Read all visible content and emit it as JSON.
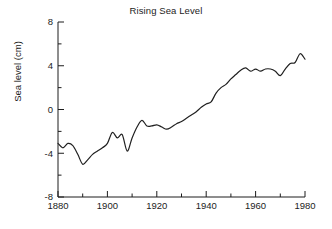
{
  "chart_data": {
    "type": "line",
    "title": "Rising Sea Level",
    "xlabel": "",
    "ylabel": "Sea level (cm)",
    "xlim": [
      1880,
      1980
    ],
    "ylim": [
      -8,
      8
    ],
    "grid": false,
    "legend": null,
    "xticks": [
      1880,
      1900,
      1920,
      1940,
      1960,
      1980
    ],
    "xticklabels": [
      "1880",
      "1900",
      "1920",
      "1940",
      "1960",
      "1980"
    ],
    "xminorticks": [
      1890,
      1910,
      1930,
      1950,
      1970
    ],
    "yticks": [
      -8,
      -4,
      0,
      4,
      8
    ],
    "yticklabels": [
      "-8",
      "-4",
      "0",
      "4",
      "8"
    ],
    "yminorticks": [
      -6,
      -2,
      2,
      6
    ],
    "line_color": "#202020",
    "line_width": 1.2,
    "series": [
      {
        "name": "Global mean sea level",
        "x": [
          1880,
          1882,
          1884,
          1886,
          1888,
          1890,
          1892,
          1894,
          1896,
          1898,
          1900,
          1902,
          1904,
          1906,
          1908,
          1910,
          1912,
          1914,
          1916,
          1918,
          1920,
          1922,
          1924,
          1926,
          1928,
          1930,
          1932,
          1934,
          1936,
          1938,
          1940,
          1942,
          1944,
          1946,
          1948,
          1950,
          1952,
          1954,
          1956,
          1958,
          1960,
          1962,
          1964,
          1966,
          1968,
          1970,
          1972,
          1974,
          1976,
          1978,
          1980
        ],
        "y": [
          -3.1,
          -3.5,
          -3.1,
          -3.3,
          -4.1,
          -5.0,
          -4.6,
          -4.1,
          -3.8,
          -3.5,
          -3.1,
          -2.1,
          -2.6,
          -2.3,
          -3.8,
          -2.6,
          -1.6,
          -1.0,
          -1.5,
          -1.5,
          -1.4,
          -1.6,
          -1.8,
          -1.6,
          -1.3,
          -1.1,
          -0.8,
          -0.5,
          -0.2,
          0.2,
          0.5,
          0.7,
          1.5,
          2.0,
          2.3,
          2.8,
          3.2,
          3.6,
          3.8,
          3.5,
          3.7,
          3.5,
          3.7,
          3.7,
          3.5,
          3.1,
          3.7,
          4.2,
          4.3,
          5.1,
          4.6
        ]
      }
    ]
  },
  "axes": {
    "plot_left": 58,
    "plot_right": 305,
    "plot_top": 22,
    "plot_bottom": 197
  }
}
